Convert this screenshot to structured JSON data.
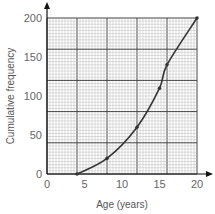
{
  "chart_data": {
    "type": "line",
    "title": "",
    "xlabel": "Age (years)",
    "ylabel": "Cumulative frequency",
    "xlim": [
      0,
      20
    ],
    "ylim": [
      0,
      200
    ],
    "x_ticks": [
      "0",
      "5",
      "10",
      "15",
      "20"
    ],
    "y_ticks": [
      "0",
      "50",
      "100",
      "150",
      "200"
    ],
    "grid": true,
    "legend": null,
    "series": [
      {
        "name": "Cumulative frequency",
        "x": [
          4,
          8,
          12,
          15,
          16,
          20
        ],
        "values": [
          0,
          20,
          60,
          110,
          140,
          200
        ]
      }
    ]
  }
}
